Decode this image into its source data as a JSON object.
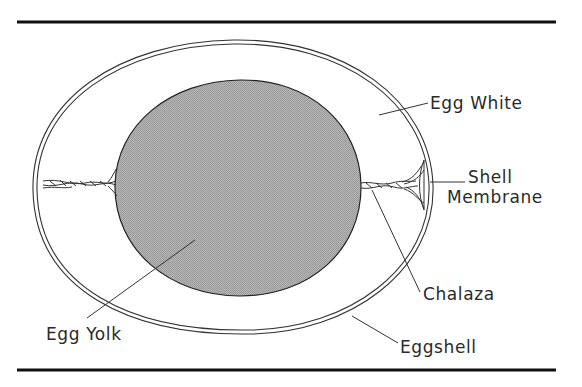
{
  "diagram": {
    "type": "labeled-cross-section",
    "subject": "Egg",
    "colors": {
      "rule": "#111111",
      "outline": "#333333",
      "yolk_fill": "#a9a9a9",
      "background": "#ffffff",
      "label_text": "#2a2a2a"
    },
    "parts": [
      {
        "id": "egg-white",
        "label": "Egg White"
      },
      {
        "id": "shell",
        "label": "Shell"
      },
      {
        "id": "membrane",
        "label": "Membrane"
      },
      {
        "id": "chalaza",
        "label": "Chalaza"
      },
      {
        "id": "eggshell",
        "label": "Eggshell"
      },
      {
        "id": "egg-yolk",
        "label": "Egg Yolk"
      }
    ],
    "labels": {
      "egg_white": "Egg White",
      "shell_membrane_line1": "Shell",
      "shell_membrane_line2": "Membrane",
      "chalaza": "Chalaza",
      "eggshell": "Eggshell",
      "egg_yolk": "Egg Yolk"
    }
  }
}
